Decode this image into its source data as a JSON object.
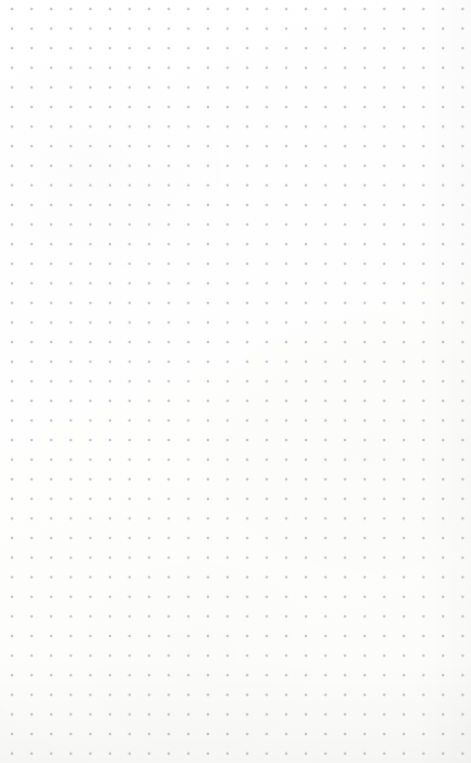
{
  "page": {
    "kind": "dot-grid-paper",
    "width_px": 471,
    "height_px": 763,
    "background_color": "#fdfdfd",
    "has_border": false,
    "has_text": false,
    "has_ui_controls": false
  },
  "grid": {
    "dot_color": "#c6c6cb",
    "dot_diameter_px": 1.7,
    "spacing_x_px": 19.6,
    "spacing_y_px": 19.6,
    "origin_x_px": 12,
    "origin_y_px": 9,
    "columns": 24,
    "rows": 39,
    "pattern": "square"
  },
  "shading": {
    "vignette_edges": "bottom, right",
    "vignette_strength": "very-faint",
    "paper_tint": "#fcfcfb"
  }
}
